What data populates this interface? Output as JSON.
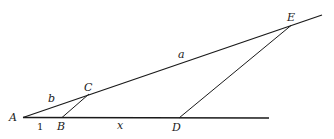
{
  "diagram": {
    "points": {
      "A": "A",
      "B": "B",
      "C": "C",
      "D": "D",
      "E": "E"
    },
    "segment_labels": {
      "AB": "1",
      "BD": "x",
      "AC": "b",
      "CE": "a"
    },
    "segments": [
      {
        "from": "A",
        "to": "end_of_base",
        "desc": "base line through A, B, D"
      },
      {
        "from": "A",
        "to": "end_of_upper",
        "desc": "upper line through A, C, E"
      },
      {
        "from": "B",
        "to": "C",
        "desc": "BC parallel to DE"
      },
      {
        "from": "D",
        "to": "E",
        "desc": "DE"
      }
    ]
  }
}
